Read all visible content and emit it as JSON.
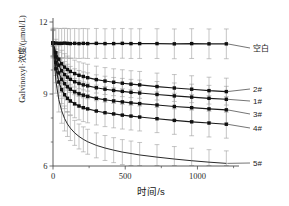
{
  "chart_data": {
    "type": "line",
    "title": "",
    "xlabel": "时间/s",
    "ylabel": "Galvinoxyl·浓度/(μmol/L)",
    "ylabel_parts": {
      "lead": "Galvinoxyl",
      "radical_dot": "·",
      "tail": "浓度/(μmol/L)"
    },
    "xlim": [
      0,
      1260
    ],
    "ylim": [
      6,
      12
    ],
    "xticks": [
      0,
      500,
      1000
    ],
    "xtick_labels": [
      "0",
      "500",
      "1000"
    ],
    "yticks": [
      6,
      9,
      12
    ],
    "ytick_labels": [
      "6",
      "9",
      "12"
    ],
    "grid": false,
    "legend_position": "right-inline-labels",
    "error_bars": true,
    "marker": "square",
    "x": [
      0,
      20,
      40,
      60,
      80,
      100,
      120,
      150,
      180,
      210,
      240,
      300,
      360,
      420,
      480,
      540,
      600,
      720,
      840,
      960,
      1080,
      1200
    ],
    "series": [
      {
        "name": "空白",
        "label": "空白",
        "values": [
          11.12,
          11.12,
          11.11,
          11.11,
          11.12,
          11.11,
          11.1,
          11.11,
          11.1,
          11.11,
          11.1,
          11.11,
          11.1,
          11.1,
          11.11,
          11.1,
          11.1,
          11.1,
          11.09,
          11.1,
          11.09,
          11.09
        ],
        "errors": [
          0.62,
          0.62,
          0.62,
          0.62,
          0.62,
          0.62,
          0.62,
          0.62,
          0.62,
          0.62,
          0.62,
          0.62,
          0.62,
          0.62,
          0.62,
          0.62,
          0.62,
          0.62,
          0.62,
          0.62,
          0.62,
          0.62
        ],
        "label_y_value": 11.1
      },
      {
        "name": "2#",
        "label": "2#",
        "values": [
          11.12,
          10.72,
          10.45,
          10.26,
          10.12,
          10.02,
          9.94,
          9.85,
          9.78,
          9.73,
          9.68,
          9.6,
          9.54,
          9.49,
          9.45,
          9.41,
          9.38,
          9.31,
          9.25,
          9.2,
          9.14,
          9.1
        ],
        "errors": [
          0.56,
          0.56,
          0.56,
          0.56,
          0.56,
          0.56,
          0.56,
          0.56,
          0.56,
          0.56,
          0.56,
          0.56,
          0.56,
          0.56,
          0.56,
          0.56,
          0.56,
          0.56,
          0.56,
          0.56,
          0.56,
          0.56
        ],
        "label_y_value": 9.28
      },
      {
        "name": "1#",
        "label": "1#",
        "values": [
          11.12,
          10.55,
          10.2,
          9.97,
          9.81,
          9.7,
          9.61,
          9.51,
          9.44,
          9.38,
          9.34,
          9.26,
          9.2,
          9.15,
          9.11,
          9.07,
          9.04,
          8.98,
          8.92,
          8.87,
          8.82,
          8.78
        ],
        "errors": [
          0.54,
          0.54,
          0.54,
          0.54,
          0.54,
          0.54,
          0.54,
          0.54,
          0.54,
          0.54,
          0.54,
          0.54,
          0.54,
          0.54,
          0.54,
          0.54,
          0.54,
          0.54,
          0.54,
          0.54,
          0.54,
          0.54
        ],
        "label_y_value": 8.9
      },
      {
        "name": "3#",
        "label": "3#",
        "values": [
          11.12,
          10.32,
          9.88,
          9.61,
          9.43,
          9.3,
          9.2,
          9.09,
          9.01,
          8.95,
          8.9,
          8.82,
          8.76,
          8.71,
          8.67,
          8.63,
          8.6,
          8.54,
          8.48,
          8.43,
          8.38,
          8.34
        ],
        "errors": [
          0.55,
          0.55,
          0.55,
          0.55,
          0.55,
          0.55,
          0.55,
          0.55,
          0.55,
          0.55,
          0.55,
          0.55,
          0.55,
          0.55,
          0.55,
          0.55,
          0.55,
          0.55,
          0.55,
          0.55,
          0.55,
          0.55
        ],
        "label_y_value": 8.45
      },
      {
        "name": "4#",
        "label": "4#",
        "values": [
          11.12,
          10.05,
          9.5,
          9.18,
          8.97,
          8.82,
          8.71,
          8.59,
          8.5,
          8.43,
          8.38,
          8.29,
          8.22,
          8.17,
          8.12,
          8.08,
          8.04,
          7.97,
          7.9,
          7.84,
          7.79,
          7.74
        ],
        "errors": [
          0.58,
          0.58,
          0.58,
          0.58,
          0.58,
          0.58,
          0.58,
          0.58,
          0.58,
          0.58,
          0.58,
          0.58,
          0.58,
          0.58,
          0.58,
          0.58,
          0.58,
          0.58,
          0.58,
          0.58,
          0.58,
          0.58
        ],
        "label_y_value": 7.8
      },
      {
        "name": "5#",
        "label": "5#",
        "values": [
          11.12,
          9.55,
          8.77,
          8.3,
          7.98,
          7.75,
          7.58,
          7.38,
          7.23,
          7.11,
          7.01,
          6.86,
          6.75,
          6.66,
          6.58,
          6.52,
          6.46,
          6.37,
          6.29,
          6.22,
          6.16,
          6.11
        ],
        "errors": [
          0.52,
          0.52,
          0.52,
          0.52,
          0.52,
          0.52,
          0.52,
          0.52,
          0.52,
          0.52,
          0.52,
          0.52,
          0.52,
          0.52,
          0.52,
          0.52,
          0.52,
          0.52,
          0.52,
          0.52,
          0.52,
          0.52
        ],
        "markers": false,
        "label_y_value": 6.15
      }
    ],
    "annotations": [
      {
        "text": "空白",
        "series": "空白"
      },
      {
        "text": "2#",
        "series": "2#"
      },
      {
        "text": "1#",
        "series": "1#"
      },
      {
        "text": "3#",
        "series": "3#"
      },
      {
        "text": "4#",
        "series": "4#"
      },
      {
        "text": "5#",
        "series": "5#"
      }
    ]
  }
}
